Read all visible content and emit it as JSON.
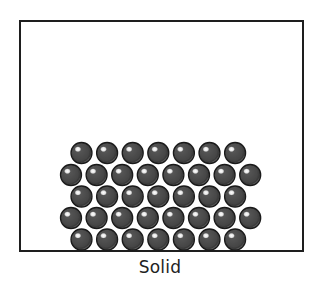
{
  "diagram": {
    "caption": "Solid",
    "state_of_matter": "solid",
    "container": {
      "shape": "rectangle",
      "border_color": "#1e1e1e",
      "fill_color": "#ffffff"
    },
    "particles": {
      "icon": "sphere-particle-icon",
      "fill_color": "#4a4a4a",
      "outline_color": "#1a1a1a",
      "rim_color": "#8a8a8a",
      "highlight_color": "#ffffff",
      "arrangement": "closely packed, regular offset rows at bottom of container",
      "rows": [
        {
          "row": 1,
          "count": 7
        },
        {
          "row": 2,
          "count": 8
        },
        {
          "row": 3,
          "count": 7
        },
        {
          "row": 4,
          "count": 8
        },
        {
          "row": 5,
          "count": 7
        }
      ],
      "total": 37
    }
  }
}
